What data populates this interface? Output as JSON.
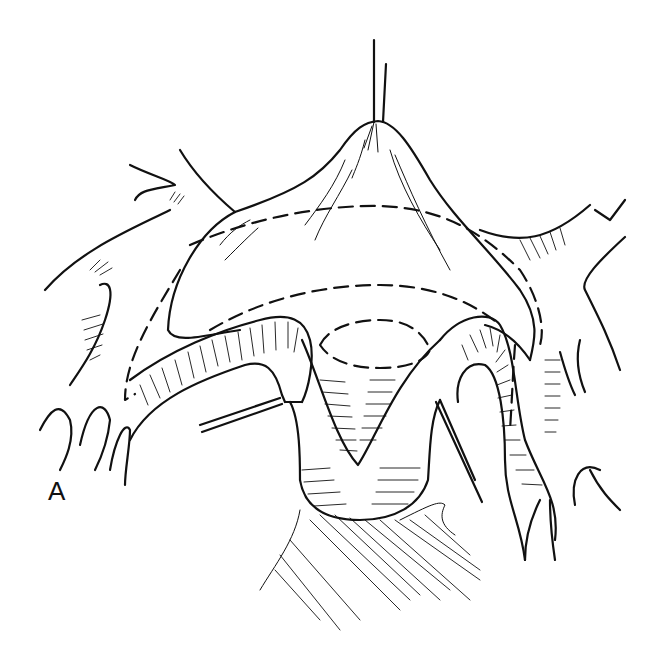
{
  "figure": {
    "panel_label": "A",
    "style": "black ink surgical line illustration on white",
    "colors": {
      "ink": "#111111",
      "background": "#ffffff"
    },
    "elements": [
      "traction-suture",
      "elevated-tissue-flap",
      "dashed-incision-lines",
      "curved-vessel-arches",
      "u-shaped-lumen",
      "retraction-sutures",
      "branching-vessels-left",
      "branching-vessels-right",
      "underlying-muscle-fibers"
    ]
  }
}
